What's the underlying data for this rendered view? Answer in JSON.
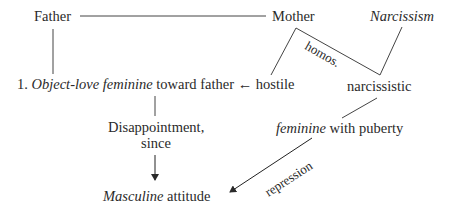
{
  "nodes": {
    "father": "Father",
    "mother": "Mother",
    "narcissism": "Narcissism",
    "object_love_num": "1.",
    "object_love_italic": "Object-love feminine",
    "object_love_rest": "toward father",
    "arrow_left": "←",
    "hostile": "hostile",
    "narcissistic": "narcissistic",
    "disappointment_line1": "Disappointment,",
    "disappointment_line2": "since",
    "feminine_italic": "feminine",
    "feminine_rest": "with puberty",
    "masculine_italic": "Masculine",
    "masculine_rest": "attitude"
  },
  "edge_labels": {
    "homos": "homos.",
    "repression": "repression"
  }
}
